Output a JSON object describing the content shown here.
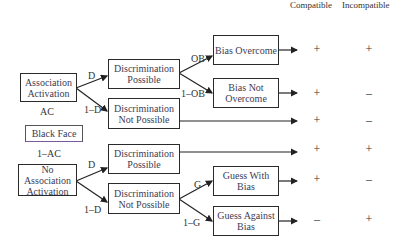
{
  "headers": {
    "compatible": "Compatible",
    "incompatible": "Incompatible"
  },
  "boxes": {
    "association_activation": "Association Activation",
    "disc_possible_top": "Discrimination Possible",
    "disc_not_possible_top": "Discrimination Not Possible",
    "bias_overcome": "Bias Overcome",
    "bias_not_overcome": "Bias Not Overcome",
    "black_face": "Black Face",
    "no_association_activation": "No Association Activation",
    "disc_possible_bottom": "Discrimination Possible",
    "disc_not_possible_bottom": "Discrimination Not Possible",
    "guess_with_bias": "Guess With Bias",
    "guess_against_bias": "Guess Against Bias"
  },
  "labels": {
    "ac": "AC",
    "one_minus_ac": "1–AC",
    "d_top": "D",
    "one_minus_d_top": "1–D",
    "ob": "OB",
    "one_minus_ob": "1–OB",
    "d_bottom": "D",
    "one_minus_d_bottom": "1–D",
    "g": "G",
    "one_minus_g": "1–G"
  },
  "outcomes": [
    {
      "row": "Bias Overcome",
      "compatible": "+",
      "incompatible": "+"
    },
    {
      "row": "Bias Not Overcome",
      "compatible": "+",
      "incompatible": "–"
    },
    {
      "row": "Discrimination Not Possible (AC)",
      "compatible": "+",
      "incompatible": "–"
    },
    {
      "row": "Discrimination Possible (no AC)",
      "compatible": "+",
      "incompatible": "+"
    },
    {
      "row": "Guess With Bias",
      "compatible": "+",
      "incompatible": "–"
    },
    {
      "row": "Guess Against Bias",
      "compatible": "–",
      "incompatible": "+"
    }
  ]
}
